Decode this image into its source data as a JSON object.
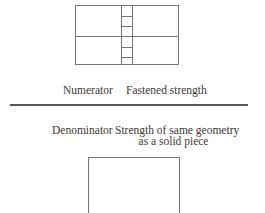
{
  "figure": {
    "numerator": {
      "label": "Numerator",
      "value": "Fastened strength"
    },
    "denominator": {
      "label": "Denominator",
      "value_line1": "Strength of same geometry",
      "value_line2": "as a solid piece"
    }
  },
  "colors": {
    "background": "#ffffff",
    "diagram_line": "#777777",
    "fraction_bar": "#555555",
    "text": "#3d3935"
  }
}
